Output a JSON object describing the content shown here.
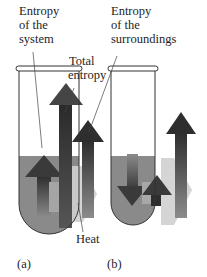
{
  "figure": {
    "labels": {
      "system_line1": "Entropy",
      "system_line2": "of the",
      "system_line3": "system",
      "total_line1": "Total",
      "total_line2": "entropy",
      "surr_line1": "Entropy",
      "surr_line2": "of the",
      "surr_line3": "surroundings",
      "heat": "Heat",
      "panel_a": "(a)",
      "panel_b": "(b)"
    },
    "colors": {
      "liquid": "#8a8a8a",
      "arrow_dark": "#3a3a3a",
      "arrow_mid": "#5a5a5a",
      "heat_arrow": "#c8c8c8",
      "tube_outline": "#333333"
    },
    "panels": [
      {
        "id": "a",
        "system_arrow": "up",
        "surroundings_arrow": "up",
        "total_arrow": "up-large"
      },
      {
        "id": "b",
        "system_arrow": "down",
        "surroundings_arrow": "up",
        "total_arrow": "up-small"
      }
    ]
  }
}
